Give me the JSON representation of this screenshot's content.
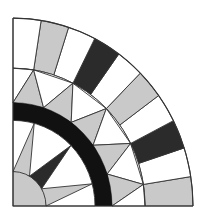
{
  "figure": {
    "center": [
      13,
      206
    ],
    "y_scale": 1.044,
    "colors": {
      "white": "#ffffff",
      "gray": "#c9c9c9",
      "dark": "#2b2b2b",
      "band": "#111111",
      "stroke": "#333333"
    },
    "radii": {
      "outer": 180,
      "outer_ring_inner": 132,
      "band_outer": 99,
      "band_inner": 82,
      "core": 33
    },
    "outer_ring": {
      "segment_degrees": 9,
      "segments": [
        "gray",
        "white",
        "black",
        "white",
        "gray",
        "white",
        "black",
        "white",
        "gray",
        "white"
      ]
    },
    "middle_ring": {
      "outer_vertices_deg": [
        81,
        63,
        45,
        27,
        9
      ],
      "inner_vertices_deg": [
        90,
        72,
        54,
        36,
        18,
        0
      ],
      "triangles": [
        {
          "pts": [
            [
              "o",
              90
            ],
            [
              "o",
              81
            ],
            [
              "i",
              90
            ]
          ],
          "fill": "white"
        },
        {
          "pts": [
            [
              "o",
              81
            ],
            [
              "i",
              90
            ],
            [
              "i",
              72
            ]
          ],
          "fill": "gray"
        },
        {
          "pts": [
            [
              "o",
              81
            ],
            [
              "i",
              72
            ],
            [
              "o",
              63
            ]
          ],
          "fill": "white"
        },
        {
          "pts": [
            [
              "o",
              63
            ],
            [
              "i",
              72
            ],
            [
              "i",
              54
            ]
          ],
          "fill": "gray"
        },
        {
          "pts": [
            [
              "o",
              63
            ],
            [
              "i",
              54
            ],
            [
              "o",
              45
            ]
          ],
          "fill": "white"
        },
        {
          "pts": [
            [
              "o",
              45
            ],
            [
              "i",
              54
            ],
            [
              "i",
              36
            ]
          ],
          "fill": "gray"
        },
        {
          "pts": [
            [
              "o",
              45
            ],
            [
              "i",
              36
            ],
            [
              "o",
              27
            ]
          ],
          "fill": "white"
        },
        {
          "pts": [
            [
              "o",
              27
            ],
            [
              "i",
              36
            ],
            [
              "i",
              18
            ]
          ],
          "fill": "gray"
        },
        {
          "pts": [
            [
              "o",
              27
            ],
            [
              "i",
              18
            ],
            [
              "o",
              9
            ]
          ],
          "fill": "white"
        },
        {
          "pts": [
            [
              "o",
              9
            ],
            [
              "i",
              18
            ],
            [
              "i",
              0
            ]
          ],
          "fill": "gray"
        },
        {
          "pts": [
            [
              "o",
              9
            ],
            [
              "i",
              0
            ],
            [
              "o",
              0
            ]
          ],
          "fill": "white"
        }
      ]
    },
    "inner_ring": {
      "spikes": [
        {
          "tip_deg": 75,
          "base_deg": [
            90,
            60
          ],
          "fill": "gray"
        },
        {
          "tip_deg": 45,
          "base_deg": [
            60,
            30
          ],
          "fill": "dark"
        },
        {
          "tip_deg": 15,
          "base_deg": [
            30,
            0
          ],
          "fill": "gray"
        }
      ]
    },
    "core_fill": "gray"
  }
}
